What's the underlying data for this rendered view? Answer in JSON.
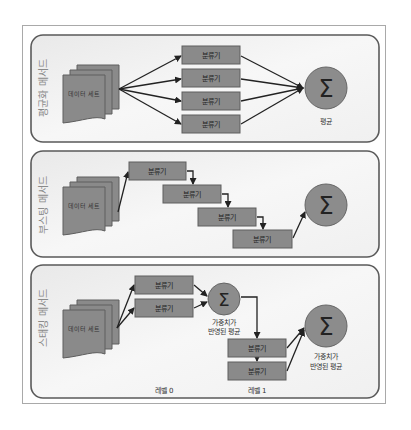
{
  "diagram": {
    "panels": [
      {
        "id": "averaging",
        "label": "평균화 메서드",
        "dataset_label": "데이터 세트",
        "classifiers": [
          "분류기",
          "분류기",
          "분류기",
          "분류기"
        ],
        "combiner_symbol": "Σ",
        "combiner_label": "평균"
      },
      {
        "id": "boosting",
        "label": "부스팅 메서드",
        "dataset_label": "데이터 세트",
        "classifiers": [
          "분류기",
          "분류기",
          "분류기",
          "분류기"
        ],
        "combiner_symbol": "Σ"
      },
      {
        "id": "stacking",
        "label": "스태킹 메서드",
        "dataset_label": "데이터 세트",
        "level0_classifiers": [
          "분류기",
          "분류기"
        ],
        "level0_combiner_symbol": "Σ",
        "level0_combiner_label_line1": "가중치가",
        "level0_combiner_label_line2": "반영된 평균",
        "level1_classifiers": [
          "분류기",
          "분류기"
        ],
        "level1_combiner_symbol": "Σ",
        "level1_combiner_label_line1": "가중치가",
        "level1_combiner_label_line2": "반영된 평균",
        "level0_label": "레벨 0",
        "level1_label": "레벨 1"
      }
    ],
    "colors": {
      "panel_border": "#5a5a5a",
      "panel_fill": "#f4f4f4",
      "box_fill": "#8a8a8a",
      "box_border": "#5e5e5e",
      "circle_fill": "#8c8c8c",
      "arrow": "#222222",
      "label_text": "#8a8a8a"
    }
  }
}
